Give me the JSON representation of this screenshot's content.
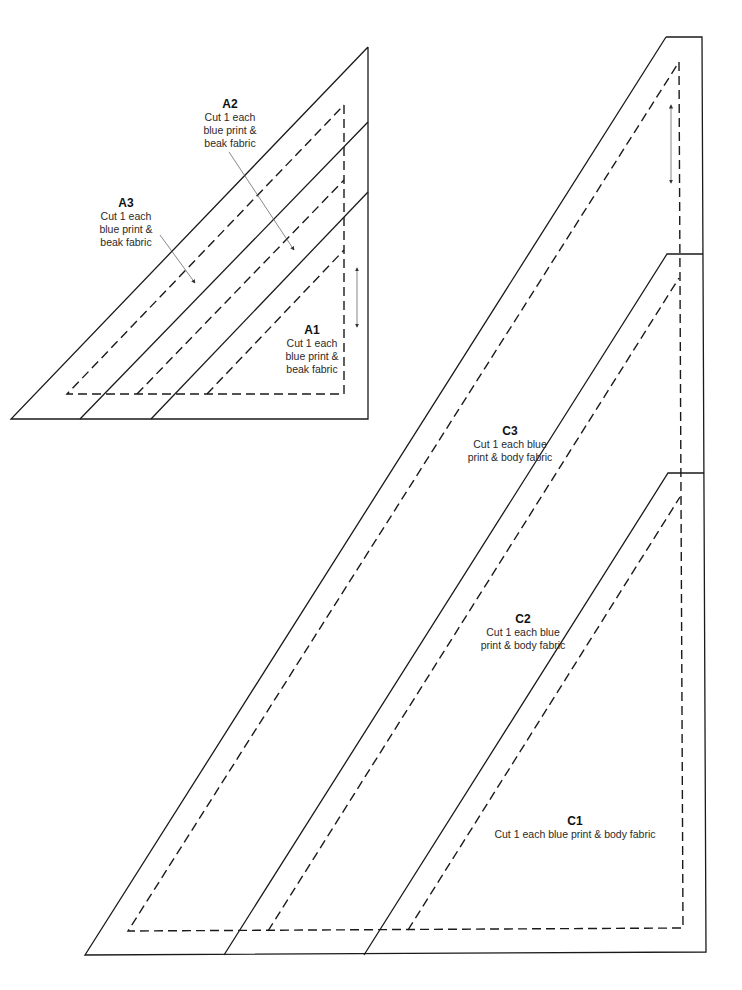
{
  "colors": {
    "line": "#1a1a1a",
    "arrow": "#555555",
    "background": "#ffffff"
  },
  "pattern_a": {
    "pieces": [
      {
        "id": "A1",
        "name": "A1",
        "instruction": "Cut 1 each\nblue print &\nbeak fabric"
      },
      {
        "id": "A2",
        "name": "A2",
        "instruction": "Cut 1 each\nblue print &\nbeak fabric"
      },
      {
        "id": "A3",
        "name": "A3",
        "instruction": "Cut 1 each\nblue print &\nbeak fabric"
      }
    ]
  },
  "pattern_c": {
    "pieces": [
      {
        "id": "C1",
        "name": "C1",
        "instruction": "Cut 1 each blue print & body fabric"
      },
      {
        "id": "C2",
        "name": "C2",
        "instruction": "Cut 1 each blue\nprint & body fabric"
      },
      {
        "id": "C3",
        "name": "C3",
        "instruction": "Cut 1 each blue\nprint & body fabric"
      }
    ]
  },
  "icons": {
    "grain_arrow": "double-headed-arrow",
    "pointer_arrow": "arrow"
  }
}
